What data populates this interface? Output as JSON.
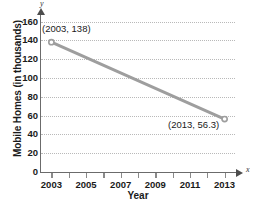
{
  "chart_data": {
    "type": "line",
    "title": "",
    "xlabel": "Year",
    "ylabel": "Mobile Homes (in thousands)",
    "x": [
      2003,
      2013
    ],
    "values": [
      138,
      56.3
    ],
    "series": [
      {
        "name": "Mobile Homes",
        "x": [
          2003,
          2013
        ],
        "values": [
          138,
          56.3
        ]
      }
    ],
    "xlim": [
      2002.4,
      2013.6
    ],
    "ylim": [
      0,
      168
    ],
    "xticks": [
      2003,
      2004,
      2005,
      2006,
      2007,
      2008,
      2009,
      2010,
      2011,
      2012,
      2013
    ],
    "xtick_labels": [
      "2003",
      "",
      "2005",
      "",
      "2007",
      "",
      "2009",
      "",
      "2011",
      "",
      "2013"
    ],
    "yticks": [
      0,
      20,
      40,
      60,
      80,
      100,
      120,
      140,
      160
    ],
    "ytick_labels": [
      "0",
      "20",
      "40",
      "60",
      "80",
      "100",
      "120",
      "140",
      "160"
    ],
    "grid": "horizontal-dotted",
    "legend": "none",
    "annotations": [
      {
        "text": "(2003, 138)",
        "x": 2003,
        "y": 138
      },
      {
        "text": "(2013, 56.3)",
        "x": 2013,
        "y": 56.3
      }
    ],
    "axis_variable_labels": {
      "x": "x",
      "y": "y"
    },
    "colors": {
      "line": "#9e9e9e",
      "marker": "#9e9e9e",
      "grid": "#b9b9b9",
      "axis": "#6b6b6b",
      "text": "#1a1a1a"
    }
  }
}
